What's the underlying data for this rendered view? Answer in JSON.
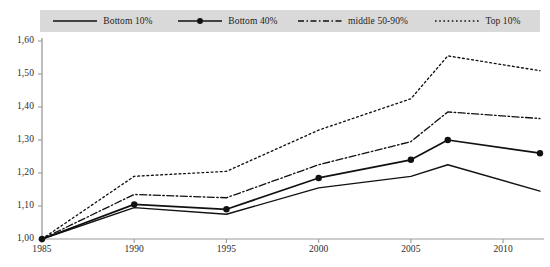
{
  "legend": {
    "items": [
      {
        "label": "Bottom 10%",
        "style": "solid-thin",
        "icon": "line-solid-icon"
      },
      {
        "label": "Bottom 40%",
        "style": "solid-marker",
        "icon": "line-solid-marker-icon"
      },
      {
        "label": "middle 50-90%",
        "style": "dash-dot",
        "icon": "line-dash-dot-icon"
      },
      {
        "label": "Top 10%",
        "style": "dotted",
        "icon": "line-dotted-icon"
      }
    ],
    "background": "#d9d9d9"
  },
  "colors": {
    "line": "#111111",
    "axis": "#9a9a9a",
    "text": "#2b2b2b",
    "background": "#ffffff"
  },
  "chart_data": {
    "type": "line",
    "title": "",
    "xlabel": "",
    "ylabel": "",
    "xlim": [
      1985,
      2012
    ],
    "ylim": [
      1.0,
      1.6
    ],
    "grid": false,
    "legend_position": "top",
    "ytick_labels": [
      "1,60",
      "1,50",
      "1,40",
      "1,30",
      "1,20",
      "1,10",
      "1,00"
    ],
    "ytick_values": [
      1.6,
      1.5,
      1.4,
      1.3,
      1.2,
      1.1,
      1.0
    ],
    "xtick_labels": [
      "1985",
      "1990",
      "1995",
      "2000",
      "2005",
      "2010"
    ],
    "xtick_values": [
      1985,
      1990,
      1995,
      2000,
      2005,
      2010
    ],
    "x": [
      1985,
      1990,
      1995,
      2000,
      2005,
      2007,
      2012
    ],
    "series": [
      {
        "name": "Bottom 10%",
        "style": "solid-thin",
        "markers": false,
        "values": [
          1.0,
          1.095,
          1.075,
          1.155,
          1.19,
          1.225,
          1.145
        ]
      },
      {
        "name": "Bottom 40%",
        "style": "solid-marker",
        "markers": true,
        "marker_x": [
          1985,
          1990,
          1995,
          2000,
          2005,
          2007,
          2012
        ],
        "values": [
          1.0,
          1.105,
          1.09,
          1.185,
          1.24,
          1.3,
          1.26
        ]
      },
      {
        "name": "middle 50-90%",
        "style": "dash-dot",
        "markers": false,
        "values": [
          1.0,
          1.135,
          1.125,
          1.225,
          1.295,
          1.385,
          1.365
        ]
      },
      {
        "name": "Top 10%",
        "style": "dotted",
        "markers": false,
        "values": [
          1.0,
          1.19,
          1.205,
          1.33,
          1.425,
          1.555,
          1.51
        ]
      }
    ]
  }
}
